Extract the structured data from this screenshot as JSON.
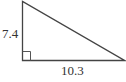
{
  "diagram": {
    "type": "right-triangle",
    "side_labels": {
      "vertical_leg": "7.4",
      "horizontal_leg": "10.3"
    },
    "right_angle_marker": true,
    "stroke_color": "#444444"
  }
}
